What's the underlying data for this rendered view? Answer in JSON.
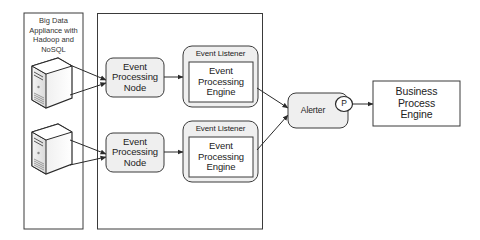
{
  "diagram": {
    "appliance": {
      "label_lines": [
        "Big Data",
        "Appliance with",
        "Hadoop and",
        "NoSQL"
      ],
      "servers": [
        "server-1",
        "server-2"
      ]
    },
    "processing_nodes": [
      {
        "label_lines": [
          "Event",
          "Processing",
          "Node"
        ]
      },
      {
        "label_lines": [
          "Event",
          "Processing",
          "Node"
        ]
      }
    ],
    "listeners": [
      {
        "title": "Event Listener",
        "engine_lines": [
          "Event",
          "Processing",
          "Engine"
        ]
      },
      {
        "title": "Event Listener",
        "engine_lines": [
          "Event",
          "Processing",
          "Engine"
        ]
      }
    ],
    "alerter": {
      "label": "Alerter",
      "port_label": "P"
    },
    "business_process_engine": {
      "label_lines": [
        "Business",
        "Process",
        "Engine"
      ]
    },
    "colors": {
      "stroke": "#3a3a3a",
      "node_fill": "#efefef",
      "box_fill": "#ffffff",
      "text": "#222222"
    }
  }
}
